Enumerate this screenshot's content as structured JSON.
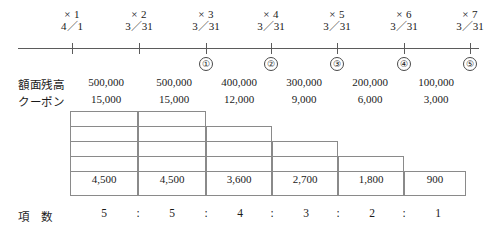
{
  "diagram": {
    "timeline": {
      "periods": [
        {
          "multiplier": "× 1",
          "date": "4／1"
        },
        {
          "multiplier": "× 2",
          "date": "3／31"
        },
        {
          "multiplier": "× 3",
          "date": "3／31"
        },
        {
          "multiplier": "× 4",
          "date": "3／31"
        },
        {
          "multiplier": "× 5",
          "date": "3／31"
        },
        {
          "multiplier": "× 6",
          "date": "3／31"
        },
        {
          "multiplier": "× 7",
          "date": "3／31"
        }
      ],
      "markers": [
        "①",
        "②",
        "③",
        "④",
        "⑤"
      ]
    },
    "rows": {
      "face_value_label": "額面残高",
      "face_values": [
        "500,000",
        "500,000",
        "400,000",
        "300,000",
        "200,000",
        "100,000"
      ],
      "coupon_label": "クーポン",
      "coupons": [
        "15,000",
        "15,000",
        "12,000",
        "9,000",
        "6,000",
        "3,000"
      ]
    },
    "staircase": {
      "heights": [
        5,
        5,
        4,
        3,
        2,
        1
      ],
      "bottom_values": [
        "4,500",
        "4,500",
        "3,600",
        "2,700",
        "1,800",
        "900"
      ]
    },
    "ratio": {
      "label": "項　数",
      "values": [
        "5",
        "5",
        "4",
        "3",
        "2",
        "1"
      ],
      "separator": ":"
    },
    "colors": {
      "ink": "#1a1a1a",
      "axis": "#5b5b5b",
      "grid": "#8a8a8a",
      "background": "#ffffff"
    }
  }
}
